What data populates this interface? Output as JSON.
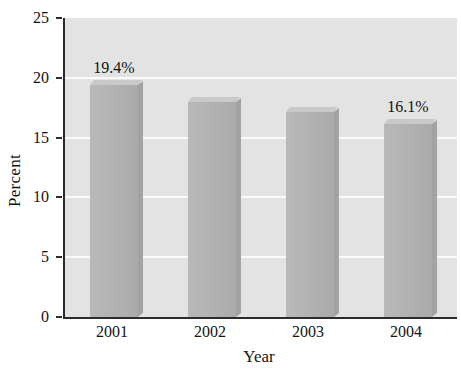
{
  "chart_data": {
    "type": "bar",
    "title": "",
    "xlabel": "Year",
    "ylabel": "Percent",
    "categories": [
      "2001",
      "2002",
      "2003",
      "2004"
    ],
    "values": [
      19.4,
      18.0,
      17.1,
      16.1
    ],
    "value_labels": [
      "19.4%",
      "",
      "",
      "16.1%"
    ],
    "ylim": [
      0,
      25
    ],
    "yticks": [
      0,
      5,
      10,
      15,
      20,
      25
    ],
    "ytick_labels": [
      "0",
      "5",
      "10",
      "15",
      "20",
      "25"
    ],
    "grid": true,
    "grid_axis": "y",
    "grid_color": "#fbfbfb",
    "legend": false,
    "series": [
      {
        "name": "Percent",
        "values": [
          19.4,
          18.0,
          17.1,
          16.1
        ]
      }
    ],
    "colors": {
      "bar_face": "#b4b4b4",
      "bar_top": "#c9c9c9",
      "bar_side": "#a2a2a2",
      "plot_background": "#e3e3e3",
      "figure_background": "#ffffff",
      "axis": "#2b2b2b",
      "text": "#141414"
    }
  },
  "axes": {
    "y_title": "Percent",
    "x_title": "Year"
  }
}
